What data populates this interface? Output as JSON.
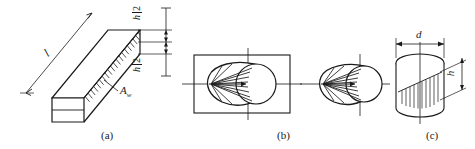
{
  "figure": {
    "type": "engineering-line-drawing",
    "background_color": "#ffffff",
    "line_color": "#1a1a1a"
  },
  "panels": [
    {
      "id": "a",
      "caption": "(a)",
      "name": "isometric-beam-web-area",
      "labels": {
        "length": "l",
        "half_height_top": {
          "numerator": "h",
          "denominator": "2"
        },
        "half_height_bottom": {
          "numerator": "h",
          "denominator": "2"
        },
        "area": "A",
        "area_subscript": "w"
      }
    },
    {
      "id": "b",
      "caption": "(b)",
      "name": "rectangular-section-shear-distribution",
      "labels": {}
    },
    {
      "id": "c",
      "caption": "(c)",
      "name": "circular-cylinder-section",
      "labels": {
        "diameter": "d",
        "height": "h"
      }
    }
  ],
  "captions": {
    "a": "(a)",
    "b": "(b)",
    "c": "(c)"
  }
}
